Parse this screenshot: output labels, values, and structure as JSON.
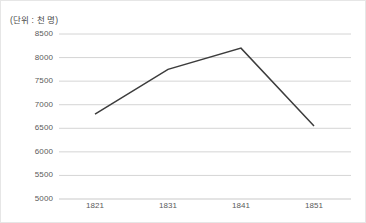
{
  "unit_label": "(단위 : 천 명)",
  "chart_data": {
    "type": "line",
    "title": "",
    "subtitle": "",
    "xlabel": "",
    "ylabel": "",
    "unit_note": "(단위 : 천 명)",
    "categories": [
      "1821",
      "1831",
      "1841",
      "1851"
    ],
    "x": [
      1821,
      1831,
      1841,
      1851
    ],
    "values": [
      6800,
      7750,
      8200,
      6550
    ],
    "series": [
      {
        "name": "",
        "values": [
          6800,
          7750,
          8200,
          6550
        ],
        "color": "#3c3c3c"
      }
    ],
    "ylim": [
      5000,
      8500
    ],
    "ytick_step": 500,
    "ytick_labels": [
      "5000",
      "5500",
      "6000",
      "6500",
      "7000",
      "7500",
      "8000",
      "8500"
    ],
    "ytick_values": [
      5000,
      5500,
      6000,
      6500,
      7000,
      7500,
      8000,
      8500
    ],
    "xtick_labels": [
      "1821",
      "1831",
      "1841",
      "1851"
    ],
    "grid": {
      "horizontal": true,
      "vertical": false,
      "color": "#c9c9c9"
    },
    "legend": {
      "show": false,
      "position": "none"
    },
    "markers": false,
    "axis_line_color": "#b5b5b5",
    "line_width": 1.5,
    "plot_area": {
      "left": 58,
      "right": 350,
      "top": 33,
      "bottom": 198
    }
  }
}
